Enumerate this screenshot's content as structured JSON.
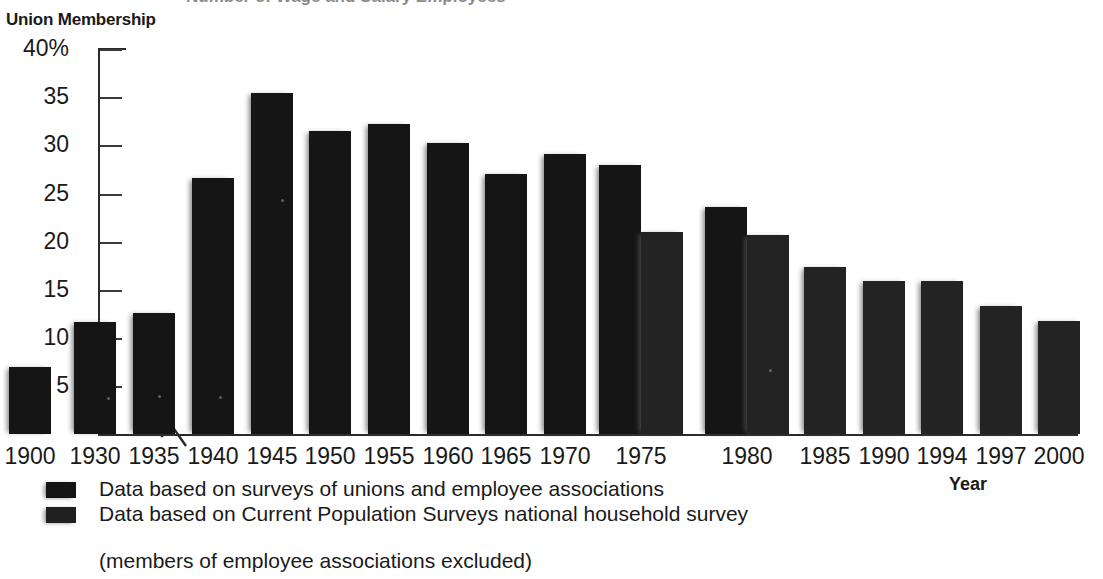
{
  "page": {
    "cutoff_ghost_text": "Number of Wage and Salary Employees",
    "axis_title": "Union Membership",
    "year_axis_label": "Year"
  },
  "chart_data": {
    "type": "bar",
    "title": "Union Membership",
    "xlabel": "Year",
    "ylabel": "Union Membership",
    "ylim": [
      0,
      40
    ],
    "yticks": [
      40,
      35,
      30,
      25,
      20,
      15,
      10,
      5
    ],
    "ytick_labels": [
      "40%",
      "35",
      "30",
      "25",
      "20",
      "15",
      "10",
      "5"
    ],
    "grid": false,
    "legend_position": "below-axis-left",
    "axis_break": {
      "present": true,
      "between": [
        "1900",
        "1930"
      ],
      "note": "x-axis scale break"
    },
    "categories": [
      "1900",
      "1930",
      "1935",
      "1940",
      "1945",
      "1950",
      "1955",
      "1960",
      "1965",
      "1970",
      "1975",
      "1980",
      "1985",
      "1990",
      "1994",
      "1997",
      "2000"
    ],
    "series": [
      {
        "name": "Data based on surveys of unions and employee associations",
        "values": [
          7.0,
          11.6,
          12.6,
          26.6,
          35.5,
          31.5,
          32.2,
          30.3,
          27.0,
          29.1,
          28.0,
          23.6,
          null,
          null,
          null,
          null,
          null
        ]
      },
      {
        "name": "Data based on Current Population Surveys national household survey (members of employee associations excluded)",
        "values": [
          null,
          null,
          null,
          null,
          null,
          null,
          null,
          null,
          null,
          null,
          21.0,
          20.7,
          17.4,
          15.9,
          15.9,
          13.3,
          11.7
        ]
      }
    ]
  },
  "legend": {
    "items": [
      {
        "label": "Data based on surveys of unions and employee associations"
      },
      {
        "label": "Data based on Current Population Surveys national household survey"
      }
    ],
    "sub_note": "(members of employee associations excluded)"
  },
  "colors": {
    "series_a": "#151515",
    "series_b": "#232323",
    "axis": "#2a2a2a",
    "text": "#1a1a1a",
    "background": "#ffffff"
  }
}
